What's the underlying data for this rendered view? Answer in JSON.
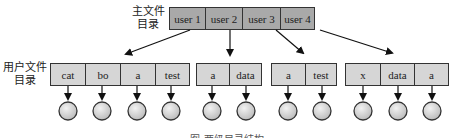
{
  "diagram": {
    "master_directory": {
      "label_line1": "主文件",
      "label_line2": "目录",
      "entries": [
        "user 1",
        "user 2",
        "user 3",
        "user 4"
      ]
    },
    "user_directory_label": {
      "line1": "用户文件",
      "line2": "目录"
    },
    "user_directories": [
      {
        "owner": "user 1",
        "files": [
          "cat",
          "bo",
          "a",
          "test"
        ]
      },
      {
        "owner": "user 2",
        "files": [
          "a",
          "data"
        ]
      },
      {
        "owner": "user 3",
        "files": [
          "a",
          "test"
        ]
      },
      {
        "owner": "user 4",
        "files": [
          "x",
          "data",
          "a"
        ]
      }
    ],
    "caption": "图 两级目录结构",
    "colors": {
      "master_fill": "#a9a9a9",
      "user_fill": "#d6d6d6",
      "stroke": "#333333",
      "file_node_fill": "#d9d9d9"
    }
  }
}
